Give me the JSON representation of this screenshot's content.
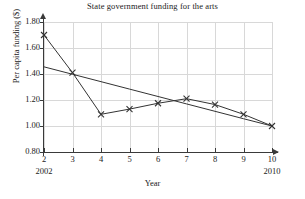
{
  "chart_data": {
    "type": "line",
    "title": "State government funding for the arts",
    "xlabel": "Year",
    "ylabel": "Per capita funding ($)",
    "xlim": [
      2,
      10
    ],
    "ylim": [
      0.8,
      1.8
    ],
    "grid": true,
    "legend": "none",
    "x": [
      2,
      3,
      4,
      5,
      6,
      7,
      8,
      9,
      10
    ],
    "x_tick_labels": [
      "2",
      "3",
      "4",
      "5",
      "6",
      "7",
      "8",
      "9",
      "10"
    ],
    "x_end_labels": {
      "start": "2002",
      "end": "2010"
    },
    "y_tick_labels": [
      "0.80",
      "1.00",
      "1.20",
      "1.40",
      "1.60",
      "1.80"
    ],
    "y_ticks": [
      0.8,
      1.0,
      1.2,
      1.4,
      1.6,
      1.8
    ],
    "series": [
      {
        "name": "Per capita funding",
        "marker": "x",
        "values": [
          1.7,
          1.41,
          1.09,
          1.13,
          1.175,
          1.21,
          1.165,
          1.09,
          1.0
        ]
      },
      {
        "name": "Trend line",
        "marker": "none",
        "values": [
          1.455,
          1.398,
          1.341,
          1.284,
          1.227,
          1.17,
          1.113,
          1.056,
          1.0
        ]
      }
    ],
    "colors": {
      "line": "#333333",
      "grid": "#d8d8d8",
      "axis": "#3a3a3a",
      "text": "#222222"
    }
  }
}
